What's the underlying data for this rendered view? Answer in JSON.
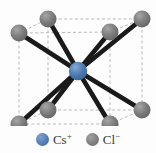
{
  "figure": {
    "background_color": "#fdfdfd",
    "width": 156,
    "height": 153
  },
  "structure": {
    "cube_edge_color": "#b9b9b9",
    "cube_edge_style": "dashed",
    "bond_color": "#1a1a1a",
    "center_ion": {
      "label": "Cs+",
      "color": "#4f7cb4",
      "x": 78,
      "y": 71,
      "r": 9
    },
    "corner_ions": [
      {
        "label": "Cl-",
        "name": "back-top-left",
        "x": 19,
        "y": 33,
        "r": 8.5
      },
      {
        "label": "Cl-",
        "name": "back-top-right",
        "x": 110,
        "y": 32,
        "r": 8.5
      },
      {
        "label": "Cl-",
        "name": "front-top-left",
        "x": 48,
        "y": 19,
        "r": 8.5
      },
      {
        "label": "Cl-",
        "name": "front-top-right",
        "x": 142,
        "y": 19,
        "r": 8.5
      },
      {
        "label": "Cl-",
        "name": "back-bottom-left",
        "x": 19,
        "y": 124,
        "r": 8.5
      },
      {
        "label": "Cl-",
        "name": "back-bottom-right",
        "x": 110,
        "y": 124,
        "r": 8.5
      },
      {
        "label": "Cl-",
        "name": "front-bottom-left",
        "x": 48,
        "y": 110,
        "r": 8.5
      },
      {
        "label": "Cl-",
        "name": "front-bottom-right",
        "x": 142,
        "y": 110,
        "r": 8.5
      }
    ],
    "bond_count": 8,
    "coordination_number": 8
  },
  "legend": {
    "items": [
      {
        "symbol": "Cs",
        "charge": "+",
        "color": "#4f7cb4",
        "icon": "sphere-icon"
      },
      {
        "symbol": "Cl",
        "charge": "−",
        "color": "#7d7d7d",
        "icon": "sphere-icon"
      }
    ]
  }
}
